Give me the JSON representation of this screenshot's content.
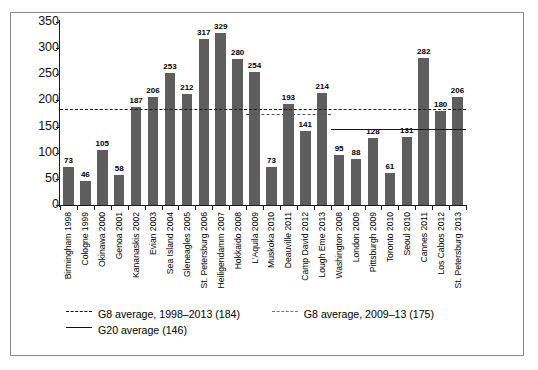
{
  "chart_data": {
    "type": "bar",
    "title": "",
    "xlabel": "",
    "ylabel": "",
    "ylim": [
      0,
      350
    ],
    "ytick_values": [
      0,
      50,
      100,
      150,
      200,
      250,
      300,
      350
    ],
    "ytick_labels": [
      "0",
      "50",
      "100",
      "150",
      "200",
      "250",
      "300",
      "350"
    ],
    "grid": false,
    "legend_position": "below-axes",
    "categories": [
      "Birmingham 1998",
      "Cologne 1999",
      "Okinawa 2000",
      "Genoa 2001",
      "Kananaskis 2002",
      "Evian 2003",
      "Sea Island 2004",
      "Gleneagles 2005",
      "St. Petersburg 2006",
      "Heiligendamm 2007",
      "Hokkaido 2008",
      "L'Aquila 2009",
      "Muskoka 2010",
      "Deauville 2011",
      "Camp David 2012",
      "Lough Eme 2013",
      "Washington 2008",
      "London 2009",
      "Pittsburgh 2009",
      "Toronto 2010",
      "Seoul 2010",
      "Cannes 2011",
      "Los Cabos 2012",
      "St. Petersburg 2013"
    ],
    "values": [
      73,
      46,
      105,
      58,
      187,
      206,
      253,
      212,
      317,
      329,
      280,
      254,
      73,
      193,
      141,
      214,
      95,
      88,
      128,
      61,
      131,
      282,
      180,
      206
    ],
    "bar_labels": [
      "73",
      "46",
      "105",
      "58",
      "187",
      "206",
      "253",
      "212",
      "317",
      "329",
      "280",
      "254",
      "73",
      "193",
      "141",
      "214",
      "95",
      "88",
      "128",
      "61",
      "131",
      "282",
      "180",
      "206"
    ],
    "bar_color": "#5e5e5e",
    "reference_lines": [
      {
        "name": "g8-average-1998-2013",
        "label": "G8 average, 1998–2013 (184)",
        "value": 184,
        "style": "dashed",
        "color": "#1a1a1a",
        "span_start_index": 0,
        "span_end_index": 23
      },
      {
        "name": "g8-average-2009-13",
        "label": "G8 average, 2009–13 (175)",
        "value": 175,
        "style": "dashed",
        "color": "#555555",
        "span_start_index": 11,
        "span_end_index": 15
      },
      {
        "name": "g20-average",
        "label": "G20 average (146)",
        "value": 146,
        "style": "solid",
        "color": "#1a1a1a",
        "span_start_index": 16,
        "span_end_index": 23
      }
    ]
  },
  "legend": {
    "items": [
      {
        "label": "G8 average, 1998–2013 (184)",
        "style": "dashed"
      },
      {
        "label": "G8 average, 2009–13 (175)",
        "style": "dotted"
      },
      {
        "label": "G20 average (146)",
        "style": "solid"
      }
    ]
  }
}
